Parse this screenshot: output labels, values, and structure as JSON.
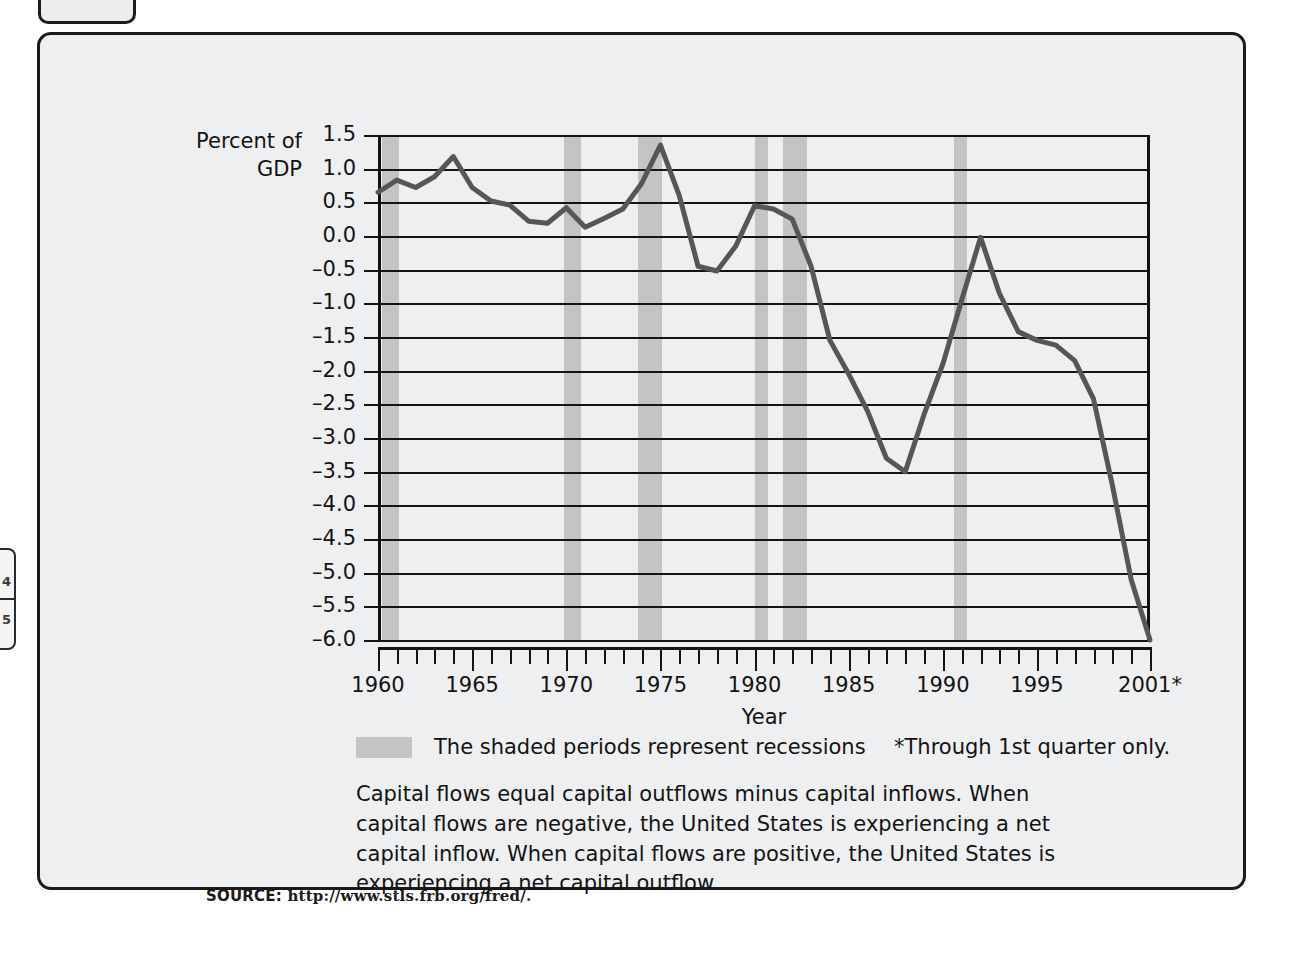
{
  "figure": {
    "axis_title_y_line1": "Percent of",
    "axis_title_y_line2": "GDP",
    "axis_title_x": "Year",
    "legend_label": "The shaded periods represent recessions",
    "footnote": "*Through 1st quarter only.",
    "caption": "Capital flows equal capital outflows minus capital inflows. When capital flows are negative, the United States is experiencing a net capital inflow. When capital flows are positive, the United States is experiencing a net capital outflow.",
    "source_prefix": "SOURCE:",
    "source_url": "http://www.stls.frb.org/fred/.",
    "side_tab_glyph_top": "4",
    "side_tab_glyph_bottom": "5"
  },
  "colors": {
    "panel_background": "#eeeff0",
    "panel_border": "#1a1a1a",
    "line": "#555658",
    "recession_band": "#c3c4c6",
    "gridline": "#141414",
    "text": "#131313"
  },
  "chart_data": {
    "type": "line",
    "title": "",
    "xlabel": "Year",
    "ylabel": "Percent of GDP",
    "xlim": [
      1960,
      2001
    ],
    "ylim": [
      -6.0,
      1.5
    ],
    "grid": true,
    "legend_position": "below",
    "y_ticks": [
      "1.5",
      "1.0",
      "0.5",
      "0.0",
      "–0.5",
      "–1.0",
      "–1.5",
      "–2.0",
      "–2.5",
      "–3.0",
      "–3.5",
      "–4.0",
      "–4.5",
      "–5.0",
      "–5.5",
      "–6.0"
    ],
    "y_tick_values": [
      1.5,
      1.0,
      0.5,
      0.0,
      -0.5,
      -1.0,
      -1.5,
      -2.0,
      -2.5,
      -3.0,
      -3.5,
      -4.0,
      -4.5,
      -5.0,
      -5.5,
      -6.0
    ],
    "x_tick_labels": [
      {
        "value": 1960,
        "label": "1960"
      },
      {
        "value": 1965,
        "label": "1965"
      },
      {
        "value": 1970,
        "label": "1970"
      },
      {
        "value": 1975,
        "label": "1975"
      },
      {
        "value": 1980,
        "label": "1980"
      },
      {
        "value": 1985,
        "label": "1985"
      },
      {
        "value": 1990,
        "label": "1990"
      },
      {
        "value": 1995,
        "label": "1995"
      },
      {
        "value": 2001,
        "label": "2001*"
      }
    ],
    "x": [
      1960,
      1961,
      1962,
      1963,
      1964,
      1965,
      1966,
      1967,
      1968,
      1969,
      1970,
      1971,
      1972,
      1973,
      1974,
      1975,
      1976,
      1977,
      1978,
      1979,
      1980,
      1981,
      1982,
      1983,
      1984,
      1985,
      1986,
      1987,
      1988,
      1989,
      1990,
      1991,
      1992,
      1993,
      1994,
      1995,
      1996,
      1997,
      1998,
      1999,
      2000,
      2001
    ],
    "series": [
      {
        "name": "Capital flows (percent of GDP)",
        "values": [
          0.65,
          0.83,
          0.72,
          0.88,
          1.18,
          0.72,
          0.52,
          0.46,
          0.22,
          0.19,
          0.42,
          0.13,
          0.26,
          0.4,
          0.78,
          1.35,
          0.6,
          -0.45,
          -0.52,
          -0.15,
          0.45,
          0.4,
          0.25,
          -0.45,
          -1.55,
          -2.05,
          -2.6,
          -3.3,
          -3.5,
          -2.65,
          -1.9,
          -0.95,
          -0.02,
          -0.85,
          -1.42,
          -1.55,
          -1.62,
          -1.85,
          -2.42,
          -3.7,
          -5.1,
          -6.0
        ]
      }
    ],
    "recession_bands": [
      {
        "start": 1960.2,
        "end": 1961.1
      },
      {
        "start": 1969.9,
        "end": 1970.8
      },
      {
        "start": 1973.8,
        "end": 1975.1
      },
      {
        "start": 1980.0,
        "end": 1980.7
      },
      {
        "start": 1981.5,
        "end": 1982.8
      },
      {
        "start": 1990.6,
        "end": 1991.3
      }
    ]
  }
}
